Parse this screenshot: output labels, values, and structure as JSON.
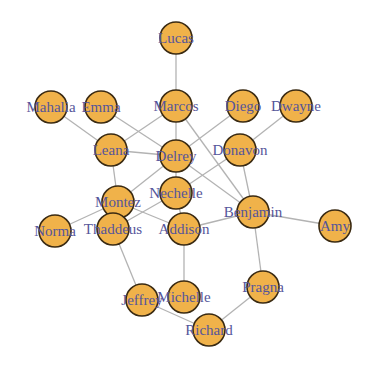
{
  "graph": {
    "node_radius": 16,
    "colors": {
      "node_fill": "#f0b24a",
      "node_stroke": "#3a2a12",
      "edge": "#b3b3b3",
      "label": "#55559a",
      "background": "#ffffff"
    },
    "nodes": [
      {
        "id": "Lucas",
        "label": "Lucas",
        "x": 176,
        "y": 38
      },
      {
        "id": "Marcos",
        "label": "Marcos",
        "x": 176,
        "y": 106
      },
      {
        "id": "Diego",
        "label": "Diego",
        "x": 243,
        "y": 106
      },
      {
        "id": "Dwayne",
        "label": "Dwayne",
        "x": 296,
        "y": 106
      },
      {
        "id": "Mahalia",
        "label": "Mahalia",
        "x": 51,
        "y": 107
      },
      {
        "id": "Emma",
        "label": "Emma",
        "x": 101,
        "y": 107
      },
      {
        "id": "Leana",
        "label": "Leana",
        "x": 111,
        "y": 150
      },
      {
        "id": "Delrey",
        "label": "Delrey",
        "x": 176,
        "y": 156
      },
      {
        "id": "Donavon",
        "label": "Donavon",
        "x": 240,
        "y": 150
      },
      {
        "id": "Nechelle",
        "label": "Nechelle",
        "x": 176,
        "y": 193
      },
      {
        "id": "Montez",
        "label": "Montez",
        "x": 118,
        "y": 202
      },
      {
        "id": "Benjamin",
        "label": "Benjamin",
        "x": 253,
        "y": 212
      },
      {
        "id": "Amy",
        "label": "Amy",
        "x": 335,
        "y": 226
      },
      {
        "id": "Norma",
        "label": "Norma",
        "x": 55,
        "y": 231
      },
      {
        "id": "Thaddeus",
        "label": "Thaddeus",
        "x": 113,
        "y": 229
      },
      {
        "id": "Addison",
        "label": "Addison",
        "x": 184,
        "y": 229
      },
      {
        "id": "Pragna",
        "label": "Pragna",
        "x": 263,
        "y": 287
      },
      {
        "id": "Jeffrey",
        "label": "Jeffrey",
        "x": 142,
        "y": 300
      },
      {
        "id": "Michelle",
        "label": "Michelle",
        "x": 184,
        "y": 297
      },
      {
        "id": "Richard",
        "label": "Richard",
        "x": 209,
        "y": 330
      }
    ],
    "edges": [
      [
        "Lucas",
        "Marcos"
      ],
      [
        "Marcos",
        "Delrey"
      ],
      [
        "Marcos",
        "Leana"
      ],
      [
        "Marcos",
        "Benjamin"
      ],
      [
        "Emma",
        "Delrey"
      ],
      [
        "Mahalia",
        "Leana"
      ],
      [
        "Leana",
        "Delrey"
      ],
      [
        "Leana",
        "Montez"
      ],
      [
        "Diego",
        "Delrey"
      ],
      [
        "Dwayne",
        "Donavon"
      ],
      [
        "Donavon",
        "Nechelle"
      ],
      [
        "Donavon",
        "Benjamin"
      ],
      [
        "Delrey",
        "Nechelle"
      ],
      [
        "Delrey",
        "Montez"
      ],
      [
        "Delrey",
        "Benjamin"
      ],
      [
        "Nechelle",
        "Thaddeus"
      ],
      [
        "Nechelle",
        "Addison"
      ],
      [
        "Montez",
        "Addison"
      ],
      [
        "Montez",
        "Norma"
      ],
      [
        "Thaddeus",
        "Jeffrey"
      ],
      [
        "Addison",
        "Benjamin"
      ],
      [
        "Addison",
        "Michelle"
      ],
      [
        "Benjamin",
        "Amy"
      ],
      [
        "Benjamin",
        "Pragna"
      ],
      [
        "Pragna",
        "Richard"
      ],
      [
        "Jeffrey",
        "Richard"
      ]
    ]
  }
}
